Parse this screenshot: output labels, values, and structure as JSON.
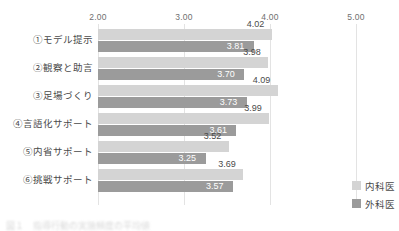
{
  "chart_data": {
    "type": "bar",
    "orientation": "horizontal",
    "title": "",
    "xlabel": "",
    "ylabel": "",
    "xlim": [
      2.0,
      5.0
    ],
    "grid": true,
    "tick_labels": [
      "2.00",
      "3.00",
      "4.00",
      "5.00"
    ],
    "tick_values": [
      2.0,
      3.0,
      4.0,
      5.0
    ],
    "legend_position": "bottom-right",
    "categories": [
      "①モデル提示",
      "②観察と助言",
      "③足場づくり",
      "④言語化サポート",
      "⑤内省サポート",
      "⑥挑戦サポート"
    ],
    "series": [
      {
        "name": "内科医",
        "color": "#d4d4d4",
        "label_color": "#4a4a4a",
        "label_position": "outside",
        "values": [
          4.02,
          3.98,
          4.09,
          3.99,
          3.52,
          3.69
        ],
        "value_labels": [
          "4.02",
          "3.98",
          "4.09",
          "3.99",
          "3.52",
          "3.69"
        ]
      },
      {
        "name": "外科医",
        "color": "#9b9b9b",
        "label_color": "#ffffff",
        "label_position": "inside",
        "values": [
          3.81,
          3.7,
          3.73,
          3.61,
          3.25,
          3.57
        ],
        "value_labels": [
          "3.81",
          "3.70",
          "3.73",
          "3.61",
          "3.25",
          "3.57"
        ]
      }
    ]
  },
  "legend": {
    "items": [
      {
        "label": "内科医",
        "color": "#d4d4d4"
      },
      {
        "label": "外科医",
        "color": "#9b9b9b"
      }
    ]
  },
  "caption": {
    "text": "図１　指導行動の実施頻度の平均値"
  }
}
